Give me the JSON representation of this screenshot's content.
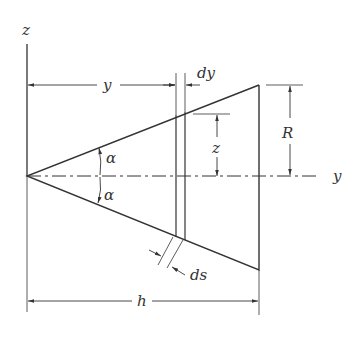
{
  "diagram": {
    "labels": {
      "z_axis": "z",
      "y_axis": "y",
      "y_dim": "y",
      "dy_dim": "dy",
      "z_dim": "z",
      "R_dim": "R",
      "alpha_top": "α",
      "alpha_bottom": "α",
      "ds_dim": "ds",
      "h_dim": "h"
    },
    "colors": {
      "line": "#333333",
      "background": "#ffffff"
    }
  }
}
